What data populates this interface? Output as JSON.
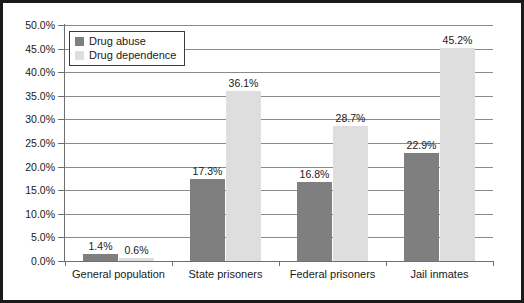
{
  "chart_data": {
    "type": "bar",
    "title": "",
    "subtitle": "",
    "xlabel": "",
    "ylabel": "",
    "categories": [
      "General population",
      "State prisoners",
      "Federal prisoners",
      "Jail inmates"
    ],
    "series": [
      {
        "name": "Drug abuse",
        "color": "#7f7f7f",
        "values": [
          1.4,
          17.3,
          16.8,
          22.9
        ],
        "labels": [
          "1.4%",
          "17.3%",
          "16.8%",
          "22.9%"
        ]
      },
      {
        "name": "Drug dependence",
        "color": "#dedede",
        "values": [
          0.6,
          36.1,
          28.7,
          45.2
        ],
        "labels": [
          "0.6%",
          "36.1%",
          "28.7%",
          "45.2%"
        ]
      }
    ],
    "ylim": [
      0,
      50
    ],
    "ytick_step": 5,
    "ytick_labels": [
      "50.0%",
      "45.0%",
      "40.0%",
      "35.0%",
      "30.0%",
      "25.0%",
      "20.0%",
      "15.0%",
      "10.0%",
      "5.0%",
      "0.0%"
    ],
    "ytick_values": [
      50,
      45,
      40,
      35,
      30,
      25,
      20,
      15,
      10,
      5,
      0
    ],
    "grid": true,
    "grid_axis": "y",
    "legend_position": "top-left",
    "value_labels": true,
    "border": true,
    "background": "#ffffff",
    "axis_color": "#6f6f6f",
    "text_color": "#1a1a1a"
  },
  "legend": {
    "items": [
      {
        "label": "Drug abuse",
        "swatch": "abuse"
      },
      {
        "label": "Drug dependence",
        "swatch": "dependence"
      }
    ]
  }
}
